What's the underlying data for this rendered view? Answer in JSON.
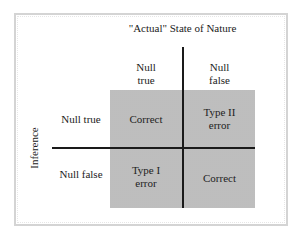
{
  "diagram": {
    "title": "\"Actual\" State of Nature",
    "row_axis_label": "Inference",
    "columns": [
      {
        "line1": "Null",
        "line2": "true"
      },
      {
        "line1": "Null",
        "line2": "false"
      }
    ],
    "rows": [
      {
        "label": "Null true"
      },
      {
        "label": "Null false"
      }
    ],
    "cells": [
      [
        {
          "line1": "Correct",
          "line2": ""
        },
        {
          "line1": "Type II",
          "line2": "error"
        }
      ],
      [
        {
          "line1": "Type I",
          "line2": "error"
        },
        {
          "line1": "Correct",
          "line2": ""
        }
      ]
    ]
  }
}
